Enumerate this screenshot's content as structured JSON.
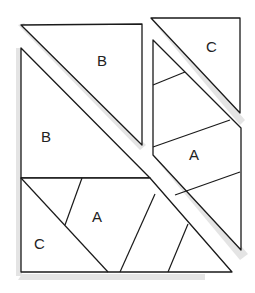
{
  "diagram": {
    "pieces": [
      {
        "id": "top-left-triangle",
        "label": "B"
      },
      {
        "id": "left-trapezoid",
        "label": "B"
      },
      {
        "id": "top-right-triangle",
        "label": "C"
      },
      {
        "id": "right-strip",
        "label": "A"
      },
      {
        "id": "bottom-left-piece",
        "label": "C"
      },
      {
        "id": "bottom-middle-piece",
        "label": "A"
      }
    ],
    "colors": {
      "stroke": "#1a1a1a",
      "shadow": "#e4e4e4",
      "background": "#ffffff"
    }
  }
}
